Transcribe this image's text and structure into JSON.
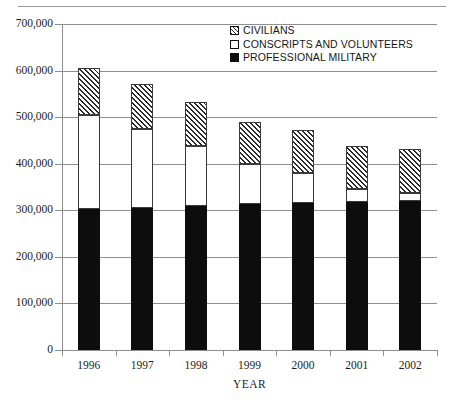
{
  "chart_data": {
    "type": "bar",
    "subtype": "stacked-vertical",
    "title": "",
    "xlabel": "YEAR",
    "ylabel": "",
    "categories": [
      "1996",
      "1997",
      "1998",
      "1999",
      "2000",
      "2001",
      "2002"
    ],
    "ylim": [
      0,
      700000
    ],
    "yticks": [
      0,
      100000,
      200000,
      300000,
      400000,
      500000,
      600000,
      700000
    ],
    "ytick_labels": [
      "0",
      "100,000",
      "200,000",
      "300,000",
      "400,000",
      "500,000",
      "600,000",
      "700,000"
    ],
    "grid": true,
    "grid_axis": "y",
    "legend_position": "top-right",
    "stack_order_bottom_to_top": [
      "PROFESSIONAL MILITARY",
      "CONSCRIPTS AND VOLUNTEERS",
      "CIVILIANS"
    ],
    "series": [
      {
        "name": "PROFESSIONAL MILITARY",
        "fill": "solid-black",
        "color": "#0d0d0d",
        "values": [
          303000,
          305000,
          310000,
          313000,
          315000,
          318000,
          320000
        ]
      },
      {
        "name": "CONSCRIPTS AND VOLUNTEERS",
        "fill": "white",
        "color": "#ffffff",
        "values": [
          201000,
          170000,
          128000,
          87000,
          65000,
          27000,
          17000
        ]
      },
      {
        "name": "CIVILIANS",
        "fill": "diagonal-hatch",
        "color": "#2b2b2b",
        "values": [
          101000,
          96000,
          95000,
          89000,
          93000,
          93000,
          94000
        ]
      }
    ],
    "totals": [
      605000,
      571000,
      533000,
      489000,
      473000,
      438000,
      431000
    ]
  },
  "axis": {
    "ytick_labels": [
      "700,000",
      "600,000",
      "500,000",
      "400,000",
      "300,000",
      "200,000",
      "100,000",
      "0"
    ],
    "xtick_labels": [
      "1996",
      "1997",
      "1998",
      "1999",
      "2000",
      "2001",
      "2002"
    ],
    "xlabel": "YEAR"
  },
  "legend": {
    "items": [
      {
        "label": "CIVILIANS",
        "swatch": "hatched-swatch-icon"
      },
      {
        "label": "CONSCRIPTS AND VOLUNTEERS",
        "swatch": "white-swatch-icon"
      },
      {
        "label": "PROFESSIONAL MILITARY",
        "swatch": "black-swatch-icon"
      }
    ]
  }
}
